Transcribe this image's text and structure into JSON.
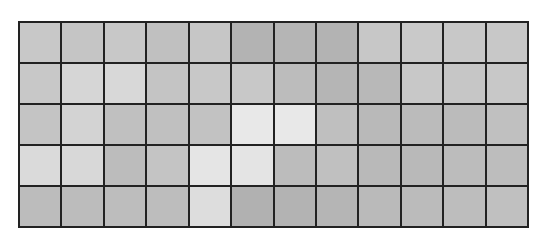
{
  "grid": {
    "rows": 5,
    "cols": 12,
    "border_color": "#222222",
    "cells": [
      [
        "#c8c8c8",
        "#c5c5c5",
        "#c8c8c8",
        "#c0c0c0",
        "#c6c6c6",
        "#b3b3b3",
        "#b5b5b5",
        "#b3b3b3",
        "#c7c7c7",
        "#c9c9c9",
        "#c8c8c8",
        "#c8c8c8"
      ],
      [
        "#c8c8c8",
        "#d6d6d6",
        "#d8d8d8",
        "#c4c4c4",
        "#c8c8c8",
        "#c8c8c8",
        "#bcbcbc",
        "#b5b5b5",
        "#b8b8b8",
        "#c8c8c8",
        "#c6c6c6",
        "#c8c8c8"
      ],
      [
        "#c4c4c4",
        "#d3d3d3",
        "#c0c0c0",
        "#c0c0c0",
        "#c2c2c2",
        "#e8e8e8",
        "#e8e8e8",
        "#bfbfbf",
        "#b9b9b9",
        "#bbbbbb",
        "#bbbbbb",
        "#c0c0c0"
      ],
      [
        "#dadada",
        "#d8d8d8",
        "#bcbcbc",
        "#c4c4c4",
        "#e5e5e5",
        "#e4e4e4",
        "#bcbcbc",
        "#c0c0c0",
        "#b9b9b9",
        "#b9b9b9",
        "#bcbcbc",
        "#bdbdbd"
      ],
      [
        "#bcbcbc",
        "#bcbcbc",
        "#bdbdbd",
        "#bdbdbd",
        "#dddddd",
        "#b1b1b1",
        "#b3b3b3",
        "#b5b5b5",
        "#bababa",
        "#bbbbbb",
        "#bdbdbd",
        "#c0c0c0"
      ]
    ]
  }
}
